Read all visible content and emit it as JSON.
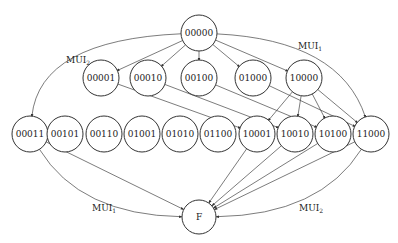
{
  "diagram": {
    "type": "state-transition-graph",
    "nodes": [
      {
        "id": "00000",
        "label": "00000",
        "x": 199,
        "y": 33
      },
      {
        "id": "00001",
        "label": "00001",
        "x": 101,
        "y": 78
      },
      {
        "id": "00010",
        "label": "00010",
        "x": 148,
        "y": 78
      },
      {
        "id": "00100",
        "label": "00100",
        "x": 199,
        "y": 78
      },
      {
        "id": "01000",
        "label": "01000",
        "x": 253,
        "y": 78
      },
      {
        "id": "10000",
        "label": "10000",
        "x": 304,
        "y": 78
      },
      {
        "id": "00011",
        "label": "00011",
        "x": 30,
        "y": 134
      },
      {
        "id": "00101",
        "label": "00101",
        "x": 65,
        "y": 134
      },
      {
        "id": "00110",
        "label": "00110",
        "x": 104,
        "y": 134
      },
      {
        "id": "01001",
        "label": "01001",
        "x": 142,
        "y": 134
      },
      {
        "id": "01010",
        "label": "01010",
        "x": 180,
        "y": 134
      },
      {
        "id": "01100",
        "label": "01100",
        "x": 218,
        "y": 134
      },
      {
        "id": "10001",
        "label": "10001",
        "x": 257,
        "y": 134
      },
      {
        "id": "10010",
        "label": "10010",
        "x": 295,
        "y": 134
      },
      {
        "id": "10100",
        "label": "10100",
        "x": 333,
        "y": 134
      },
      {
        "id": "11000",
        "label": "11000",
        "x": 371,
        "y": 134
      },
      {
        "id": "F",
        "label": "F",
        "x": 199,
        "y": 217
      }
    ],
    "edges": [
      {
        "from": "00000",
        "to": "00001"
      },
      {
        "from": "00000",
        "to": "00010"
      },
      {
        "from": "00000",
        "to": "00100"
      },
      {
        "from": "00000",
        "to": "01000"
      },
      {
        "from": "00000",
        "to": "10000"
      },
      {
        "from": "00000",
        "to": "00011",
        "label": "MUI2",
        "curved": true
      },
      {
        "from": "00000",
        "to": "11000",
        "label": "MUI1",
        "curved": true
      },
      {
        "from": "00001",
        "to": "10001"
      },
      {
        "from": "00010",
        "to": "10010"
      },
      {
        "from": "00100",
        "to": "10100"
      },
      {
        "from": "01000",
        "to": "11000"
      },
      {
        "from": "10000",
        "to": "10001"
      },
      {
        "from": "10000",
        "to": "10010"
      },
      {
        "from": "10000",
        "to": "10100"
      },
      {
        "from": "10000",
        "to": "11000"
      },
      {
        "from": "00011",
        "to": "F"
      },
      {
        "from": "00011",
        "to": "F",
        "label": "MUI1",
        "curved": true
      },
      {
        "from": "10001",
        "to": "F"
      },
      {
        "from": "10010",
        "to": "F"
      },
      {
        "from": "10100",
        "to": "F"
      },
      {
        "from": "11000",
        "to": "F"
      },
      {
        "from": "11000",
        "to": "F",
        "label": "MUI2",
        "curved": true
      }
    ],
    "labels": {
      "top_left": {
        "base": "MUI",
        "sub": "2"
      },
      "top_right": {
        "base": "MUI",
        "sub": "1"
      },
      "bottom_left": {
        "base": "MUI",
        "sub": "1"
      },
      "bottom_right": {
        "base": "MUI",
        "sub": "2"
      }
    }
  }
}
